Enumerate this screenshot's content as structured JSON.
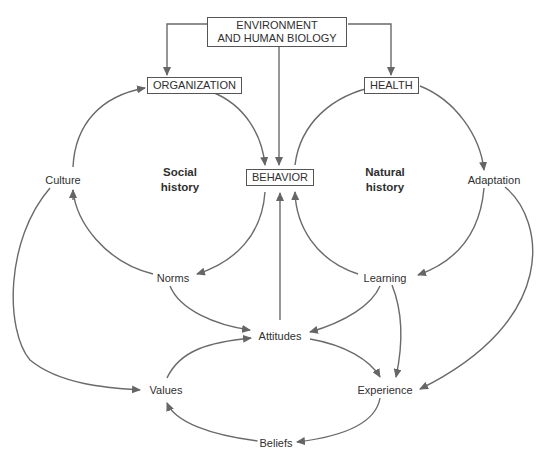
{
  "diagram": {
    "boxes": {
      "environment": {
        "line1": "ENVIRONMENT",
        "line2": "AND HUMAN BIOLOGY"
      },
      "organization": "ORGANIZATION",
      "health": "HEALTH",
      "behavior": "BEHAVIOR"
    },
    "regions": {
      "social": {
        "line1": "Social",
        "line2": "history"
      },
      "natural": {
        "line1": "Natural",
        "line2": "history"
      }
    },
    "nodes": {
      "culture": "Culture",
      "adaptation": "Adaptation",
      "norms": "Norms",
      "learning": "Learning",
      "attitudes": "Attitudes",
      "values": "Values",
      "experience": "Experience",
      "beliefs": "Beliefs"
    },
    "edges": [
      [
        "ENVIRONMENT AND HUMAN BIOLOGY",
        "ORGANIZATION"
      ],
      [
        "ENVIRONMENT AND HUMAN BIOLOGY",
        "BEHAVIOR"
      ],
      [
        "ENVIRONMENT AND HUMAN BIOLOGY",
        "HEALTH"
      ],
      [
        "ORGANIZATION",
        "BEHAVIOR"
      ],
      [
        "BEHAVIOR",
        "Norms"
      ],
      [
        "Norms",
        "Culture"
      ],
      [
        "Culture",
        "ORGANIZATION"
      ],
      [
        "BEHAVIOR",
        "HEALTH"
      ],
      [
        "HEALTH",
        "Adaptation"
      ],
      [
        "Adaptation",
        "Learning"
      ],
      [
        "Learning",
        "BEHAVIOR"
      ],
      [
        "Attitudes",
        "BEHAVIOR"
      ],
      [
        "Norms",
        "Attitudes"
      ],
      [
        "Learning",
        "Attitudes"
      ],
      [
        "Learning",
        "Experience"
      ],
      [
        "Attitudes",
        "Experience"
      ],
      [
        "Adaptation",
        "Experience"
      ],
      [
        "Culture",
        "Values"
      ],
      [
        "Values",
        "Attitudes"
      ],
      [
        "Experience",
        "Beliefs"
      ],
      [
        "Beliefs",
        "Values"
      ]
    ],
    "colors": {
      "line": "#666666",
      "text": "#2f2f2f",
      "box_border": "#555555"
    }
  }
}
